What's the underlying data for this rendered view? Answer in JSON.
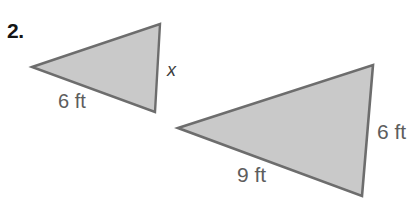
{
  "problem": {
    "number": "2.",
    "figure_type": "similar-triangles-diagram"
  },
  "colors": {
    "triangle_fill": "#c9c9c9",
    "triangle_stroke": "#6d6d6d",
    "label_text": "#5d5d5d",
    "number_text": "#151515",
    "variable_text": "#3c3c3c",
    "background": "#ffffff"
  },
  "small_triangle": {
    "name": "small-triangle",
    "vertices": [
      [
        32,
        67
      ],
      [
        160,
        24
      ],
      [
        155,
        112
      ]
    ],
    "labels": {
      "base": "6 ft",
      "unknown_side": "x"
    }
  },
  "large_triangle": {
    "name": "large-triangle",
    "vertices": [
      [
        178,
        128
      ],
      [
        373,
        65
      ],
      [
        362,
        196
      ]
    ],
    "labels": {
      "base": "9 ft",
      "right_side": "6 ft"
    }
  }
}
